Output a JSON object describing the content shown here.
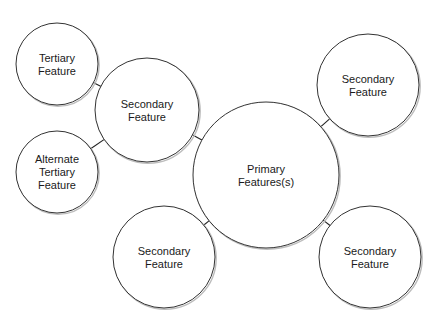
{
  "diagram": {
    "type": "bubble-map",
    "colors": {
      "stroke": "#333333",
      "fill": "#ffffff",
      "text": "#1a1a1a",
      "background": "#ffffff"
    },
    "nodes": [
      {
        "id": "primary",
        "role": "primary",
        "cx": 266,
        "cy": 175,
        "r": 73,
        "lines": [
          "Primary",
          "Features(s)"
        ]
      },
      {
        "id": "secondary-left",
        "role": "secondary",
        "cx": 147,
        "cy": 110,
        "r": 52,
        "lines": [
          "Secondary",
          "Feature"
        ]
      },
      {
        "id": "tertiary",
        "role": "tertiary",
        "cx": 57,
        "cy": 64,
        "r": 41,
        "lines": [
          "Tertiary",
          "Feature"
        ]
      },
      {
        "id": "alternate-tertiary",
        "role": "tertiary",
        "cx": 57,
        "cy": 172,
        "r": 41,
        "lines": [
          "Alternate",
          "Tertiary",
          "Feature"
        ]
      },
      {
        "id": "secondary-top-right",
        "role": "secondary",
        "cx": 368,
        "cy": 85,
        "r": 51,
        "lines": [
          "Secondary",
          "Feature"
        ]
      },
      {
        "id": "secondary-bottom-left",
        "role": "secondary",
        "cx": 164,
        "cy": 257,
        "r": 51,
        "lines": [
          "Secondary",
          "Feature"
        ]
      },
      {
        "id": "secondary-bottom-right",
        "role": "secondary",
        "cx": 370,
        "cy": 257,
        "r": 51,
        "lines": [
          "Secondary",
          "Feature"
        ]
      }
    ],
    "edges": [
      {
        "from": "primary",
        "to": "secondary-left"
      },
      {
        "from": "primary",
        "to": "secondary-top-right"
      },
      {
        "from": "primary",
        "to": "secondary-bottom-left"
      },
      {
        "from": "primary",
        "to": "secondary-bottom-right"
      },
      {
        "from": "secondary-left",
        "to": "tertiary"
      },
      {
        "from": "secondary-left",
        "to": "alternate-tertiary"
      }
    ]
  },
  "labels": {
    "primary": [
      "Primary",
      "Features(s)"
    ],
    "secondary_left": [
      "Secondary",
      "Feature"
    ],
    "tertiary": [
      "Tertiary",
      "Feature"
    ],
    "alternate_tertiary": [
      "Alternate",
      "Tertiary",
      "Feature"
    ],
    "secondary_top_right": [
      "Secondary",
      "Feature"
    ],
    "secondary_bottom_left": [
      "Secondary",
      "Feature"
    ],
    "secondary_bottom_right": [
      "Secondary",
      "Feature"
    ]
  }
}
